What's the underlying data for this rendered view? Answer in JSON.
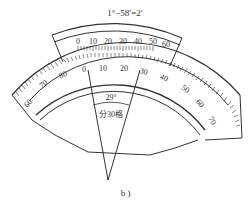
{
  "figure": {
    "caption": "b )",
    "formula": "1°−58′=2′",
    "vernier_scale": {
      "labels": [
        "0",
        "10",
        "20",
        "30",
        "40",
        "50",
        "60"
      ]
    },
    "main_scale": {
      "labels_left": [
        "60",
        "70",
        "80"
      ],
      "labels_center": [
        "0",
        "10",
        "20",
        "30",
        "40"
      ],
      "labels_right": [
        "50",
        "60",
        "70"
      ]
    },
    "angle_annotation": "29°",
    "division_annotation": "分30格"
  },
  "colors": {
    "line": "#333333",
    "background": "#ffffff"
  }
}
